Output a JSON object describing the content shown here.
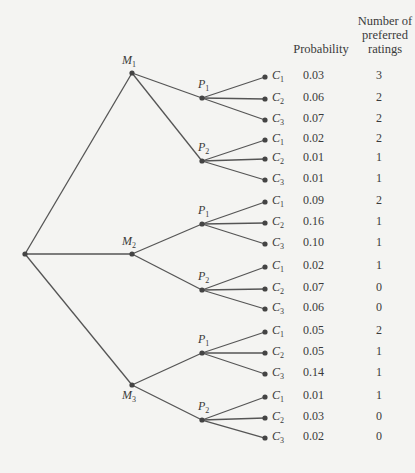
{
  "headers": {
    "probability": "Probability",
    "ratings": [
      "Number of",
      "preferred",
      "ratings"
    ]
  },
  "tree": {
    "root": "",
    "level1": [
      {
        "label": "M",
        "sub": "1",
        "children": [
          {
            "label": "P",
            "sub": "1"
          },
          {
            "label": "P",
            "sub": "2"
          }
        ]
      },
      {
        "label": "M",
        "sub": "2",
        "children": [
          {
            "label": "P",
            "sub": "1"
          },
          {
            "label": "P",
            "sub": "2"
          }
        ]
      },
      {
        "label": "M",
        "sub": "3",
        "children": [
          {
            "label": "P",
            "sub": "1"
          },
          {
            "label": "P",
            "sub": "2"
          }
        ]
      }
    ]
  },
  "outcomes": [
    {
      "path": "M1-P1-C1",
      "leaf": "C",
      "sub": "1",
      "probability": "0.03",
      "ratings": "3"
    },
    {
      "path": "M1-P1-C2",
      "leaf": "C",
      "sub": "2",
      "probability": "0.06",
      "ratings": "2"
    },
    {
      "path": "M1-P1-C3",
      "leaf": "C",
      "sub": "3",
      "probability": "0.07",
      "ratings": "2"
    },
    {
      "path": "M1-P2-C1",
      "leaf": "C",
      "sub": "1",
      "probability": "0.02",
      "ratings": "2"
    },
    {
      "path": "M1-P2-C2",
      "leaf": "C",
      "sub": "2",
      "probability": "0.01",
      "ratings": "1"
    },
    {
      "path": "M1-P2-C3",
      "leaf": "C",
      "sub": "3",
      "probability": "0.01",
      "ratings": "1"
    },
    {
      "path": "M2-P1-C1",
      "leaf": "C",
      "sub": "1",
      "probability": "0.09",
      "ratings": "2"
    },
    {
      "path": "M2-P1-C2",
      "leaf": "C",
      "sub": "2",
      "probability": "0.16",
      "ratings": "1"
    },
    {
      "path": "M2-P1-C3",
      "leaf": "C",
      "sub": "3",
      "probability": "0.10",
      "ratings": "1"
    },
    {
      "path": "M2-P2-C1",
      "leaf": "C",
      "sub": "1",
      "probability": "0.02",
      "ratings": "1"
    },
    {
      "path": "M2-P2-C2",
      "leaf": "C",
      "sub": "2",
      "probability": "0.07",
      "ratings": "0"
    },
    {
      "path": "M2-P2-C3",
      "leaf": "C",
      "sub": "3",
      "probability": "0.06",
      "ratings": "0"
    },
    {
      "path": "M3-P1-C1",
      "leaf": "C",
      "sub": "1",
      "probability": "0.05",
      "ratings": "2"
    },
    {
      "path": "M3-P1-C2",
      "leaf": "C",
      "sub": "2",
      "probability": "0.05",
      "ratings": "1"
    },
    {
      "path": "M3-P1-C3",
      "leaf": "C",
      "sub": "3",
      "probability": "0.14",
      "ratings": "1"
    },
    {
      "path": "M3-P2-C1",
      "leaf": "C",
      "sub": "1",
      "probability": "0.01",
      "ratings": "1"
    },
    {
      "path": "M3-P2-C2",
      "leaf": "C",
      "sub": "2",
      "probability": "0.03",
      "ratings": "0"
    },
    {
      "path": "M3-P2-C3",
      "leaf": "C",
      "sub": "3",
      "probability": "0.02",
      "ratings": "0"
    }
  ],
  "colors": {
    "line": "#555555",
    "text": "#3a3a3a",
    "background": "#f4f4f2"
  }
}
